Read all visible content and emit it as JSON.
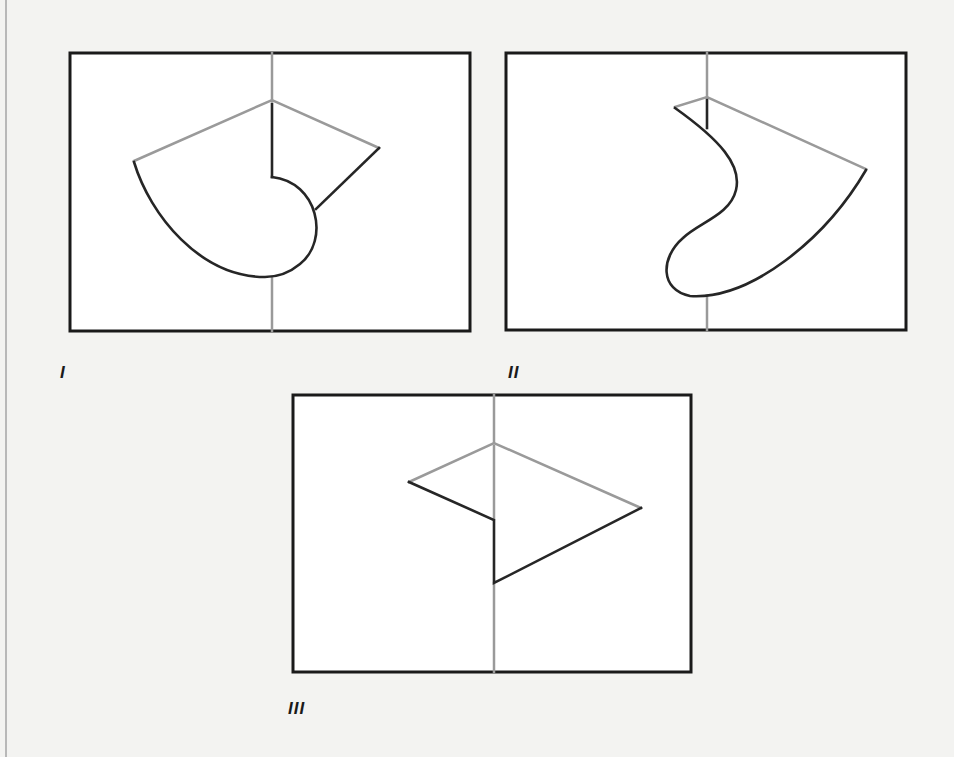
{
  "colors": {
    "page_background": "#f3f3f1",
    "frame": "#1a1a1a",
    "panel_fill": "#ffffff",
    "gray_line": "#9a9a9a",
    "dark_line": "#262626"
  },
  "figures": [
    {
      "id": "I",
      "label": "I",
      "frame": {
        "x": 70,
        "y": 53,
        "w": 400,
        "h": 278
      },
      "label_pos": {
        "x": 60,
        "y": 364
      },
      "shapes": [
        {
          "stroke": "gray",
          "d": "M 272 53 L 272 101"
        },
        {
          "stroke": "gray",
          "d": "M 272 278 L 272 331"
        },
        {
          "stroke": "gray",
          "d": "M 134 161 L 272 100 L 379 148"
        },
        {
          "stroke": "dark",
          "d": "M 272 104 L 272 177"
        },
        {
          "stroke": "dark",
          "d": "M 379 148 L 316 209"
        },
        {
          "stroke": "dark",
          "d": "M 272 177 C 318 182 330 240 300 264 C 288 274 276 277 265 277 C 200 277 150 215 134 162"
        }
      ]
    },
    {
      "id": "II",
      "label": "II",
      "frame": {
        "x": 506,
        "y": 53,
        "w": 400,
        "h": 277
      },
      "label_pos": {
        "x": 508,
        "y": 364
      },
      "shapes": [
        {
          "stroke": "gray",
          "d": "M 707 53 L 707 97"
        },
        {
          "stroke": "gray",
          "d": "M 707 296 L 707 330"
        },
        {
          "stroke": "gray",
          "d": "M 675 107 L 707 97 L 866 169"
        },
        {
          "stroke": "dark",
          "d": "M 707 100 L 707 128"
        },
        {
          "stroke": "dark",
          "d": "M 675 108 C 720 140 742 165 736 190 C 730 215 700 222 683 238 C 660 258 660 290 690 296 C 750 300 825 240 866 170"
        }
      ]
    },
    {
      "id": "III",
      "label": "III",
      "frame": {
        "x": 293,
        "y": 395,
        "w": 398,
        "h": 277
      },
      "label_pos": {
        "x": 288,
        "y": 700
      },
      "shapes": [
        {
          "stroke": "gray",
          "d": "M 494 395 L 494 443"
        },
        {
          "stroke": "gray",
          "d": "M 494 583 L 494 672"
        },
        {
          "stroke": "gray",
          "d": "M 409 482 L 494 443 L 641 508"
        },
        {
          "stroke": "gray",
          "d": "M 494 446 L 494 519"
        },
        {
          "stroke": "dark",
          "d": "M 409 482 L 494 520 L 494 583 L 641 508"
        }
      ]
    }
  ]
}
